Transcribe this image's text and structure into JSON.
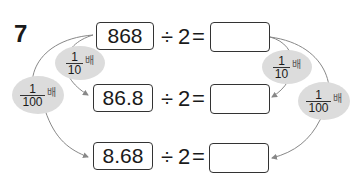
{
  "problem": {
    "number": "7",
    "rows": [
      {
        "dividend": "868",
        "operator": "÷",
        "divisor": "2",
        "equals": "=",
        "answer": ""
      },
      {
        "dividend": "86.8",
        "operator": "÷",
        "divisor": "2",
        "equals": "=",
        "answer": ""
      },
      {
        "dividend": "8.68",
        "operator": "÷",
        "divisor": "2",
        "equals": "=",
        "answer": ""
      }
    ],
    "badges": {
      "left_tenth": {
        "numerator": "1",
        "denominator": "10",
        "unit": "배"
      },
      "left_hundredth": {
        "numerator": "1",
        "denominator": "100",
        "unit": "배"
      },
      "right_tenth": {
        "numerator": "1",
        "denominator": "10",
        "unit": "배"
      },
      "right_hundredth": {
        "numerator": "1",
        "denominator": "100",
        "unit": "배"
      }
    }
  },
  "colors": {
    "badge_bg": "#dcdcdc",
    "arrow": "#888888"
  }
}
